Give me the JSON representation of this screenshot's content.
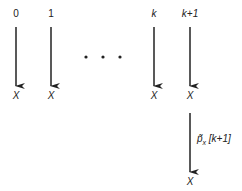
{
  "columns": [
    {
      "top_label": "0",
      "bottom_label": "X"
    },
    {
      "top_label": "1",
      "bottom_label": "X"
    },
    {
      "top_label": "k",
      "bottom_label": "X"
    },
    {
      "top_label": "k+1",
      "bottom_label": "X"
    }
  ],
  "ellipsis": "• • •",
  "extra_transition": {
    "label_main": "p̃",
    "label_sub": "x",
    "label_arg": "[k+1]",
    "bottom_label": "X"
  }
}
